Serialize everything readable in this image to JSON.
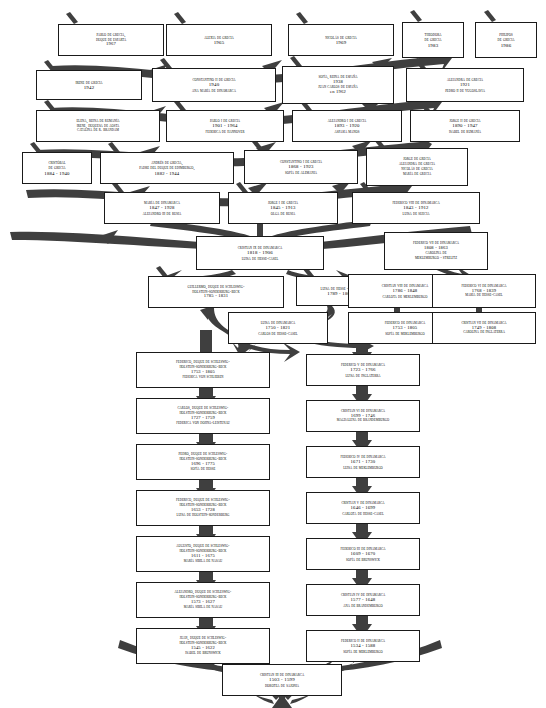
{
  "diagram": {
    "type": "genealogy-tree",
    "orientation": "bottom-up ancestors",
    "colors": {
      "background": "#ffffff",
      "box_border": "#1a1a1a",
      "arrow_fill": "#3f3f3f",
      "text": "#000000"
    },
    "nodes": [
      {
        "id": "n1",
        "lines": [
          "Pablo de Grecia,",
          "Duque de Esparta",
          "1967"
        ],
        "x": 58,
        "y": 24,
        "w": 106,
        "h": 32,
        "fs": 4.6
      },
      {
        "id": "n2",
        "lines": [
          "Alexia de Grecia",
          "1965"
        ],
        "x": 166,
        "y": 24,
        "w": 106,
        "h": 32,
        "fs": 4.9
      },
      {
        "id": "n3",
        "lines": [
          "Nicolás de Grecia",
          "1969"
        ],
        "x": 288,
        "y": 24,
        "w": 106,
        "h": 32,
        "fs": 4.9
      },
      {
        "id": "n4",
        "lines": [
          "Theodora",
          "de Grecia",
          "1983"
        ],
        "x": 402,
        "y": 22,
        "w": 62,
        "h": 36,
        "fs": 4.9
      },
      {
        "id": "n5",
        "lines": [
          "Philipos",
          "de Grecia",
          "1986"
        ],
        "x": 475,
        "y": 22,
        "w": 62,
        "h": 36,
        "fs": 4.9
      },
      {
        "id": "n6",
        "lines": [
          "Irene de Grecia",
          "1942"
        ],
        "x": 36,
        "y": 70,
        "w": 106,
        "h": 30,
        "fs": 4.9
      },
      {
        "id": "n7",
        "lines": [
          "Constantino II de Grecia",
          "1940",
          "Ana María de Dinamarca"
        ],
        "x": 152,
        "y": 68,
        "w": 124,
        "h": 34,
        "fs": 4.9
      },
      {
        "id": "n8",
        "lines": [
          "Sofía, reina de España",
          "1938",
          "Juan Carlos de España",
          "en 1962"
        ],
        "x": 282,
        "y": 66,
        "w": 112,
        "h": 38,
        "fs": 4.6
      },
      {
        "id": "n9",
        "lines": [
          "Alejandra de Grecia",
          "1921",
          "Pedro II de Yugoslavia"
        ],
        "x": 406,
        "y": 68,
        "w": 118,
        "h": 34,
        "fs": 4.7
      },
      {
        "id": "n10",
        "lines": [
          "Elena, reina de Rumanía",
          "Irene, duquesa de Aosta",
          "Catalina de R. Brandam"
        ],
        "x": 36,
        "y": 110,
        "w": 124,
        "h": 32,
        "fs": 4.6
      },
      {
        "id": "n11",
        "lines": [
          "Pablo I de Grecia",
          "1901 - 1964",
          "Federica de Hannover"
        ],
        "x": 166,
        "y": 110,
        "w": 118,
        "h": 32,
        "fs": 4.8
      },
      {
        "id": "n12",
        "lines": [
          "Alejandro I de Grecia",
          "1893 - 1920",
          "Aspasia Manos"
        ],
        "x": 292,
        "y": 110,
        "w": 110,
        "h": 32,
        "fs": 4.8
      },
      {
        "id": "n13",
        "lines": [
          "Jorge II de Grecia",
          "1890 - 1947",
          "Isabel de Rumanía"
        ],
        "x": 410,
        "y": 110,
        "w": 110,
        "h": 32,
        "fs": 4.8
      },
      {
        "id": "n14",
        "lines": [
          "Cristóbal",
          "de Grecia",
          "1884 - 1940"
        ],
        "x": 22,
        "y": 152,
        "w": 70,
        "h": 32,
        "fs": 4.8
      },
      {
        "id": "n15",
        "lines": [
          "Andrés de Grecia,",
          "Padre del Duque de Edimburgo,",
          "1882 - 1944"
        ],
        "x": 100,
        "y": 152,
        "w": 134,
        "h": 32,
        "fs": 4.7
      },
      {
        "id": "n16",
        "lines": [
          "Constantino I de Grecia",
          "1868 - 1923",
          "Sofía de Alemania"
        ],
        "x": 244,
        "y": 150,
        "w": 114,
        "h": 34,
        "fs": 4.8
      },
      {
        "id": "n17",
        "lines": [
          "Jorge de Grecia",
          "Alejandra de Grecia",
          "Nicolás de Grecia",
          "María de Grecia"
        ],
        "x": 366,
        "y": 148,
        "w": 102,
        "h": 38,
        "fs": 4.6
      },
      {
        "id": "n18",
        "lines": [
          "María de Dinamarca",
          "1847 - 1928",
          "Alejandro III de Rusia"
        ],
        "x": 104,
        "y": 192,
        "w": 116,
        "h": 32,
        "fs": 4.8
      },
      {
        "id": "n19",
        "lines": [
          "Jorge I de Grecia",
          "1845 - 1913",
          "Olga de Rusia"
        ],
        "x": 228,
        "y": 192,
        "w": 110,
        "h": 32,
        "fs": 4.8
      },
      {
        "id": "n20",
        "lines": [
          "Federico VIII de Dinamarca",
          "1843 - 1912",
          "Luisa de Suecia"
        ],
        "x": 352,
        "y": 192,
        "w": 128,
        "h": 32,
        "fs": 4.8
      },
      {
        "id": "n21",
        "lines": [
          "Cristian IX de Dinamarca",
          "1818 - 1906",
          "Luisa de Hesse-Casel"
        ],
        "x": 196,
        "y": 236,
        "w": 128,
        "h": 34,
        "fs": 4.9
      },
      {
        "id": "n22",
        "lines": [
          "Federico VII de Dinamarca",
          "1808 - 1863",
          "Carolina de",
          "Meklemburgo - Strelitz"
        ],
        "x": 384,
        "y": 232,
        "w": 104,
        "h": 38,
        "fs": 4.5
      },
      {
        "id": "n23",
        "lines": [
          "Guillermo, Duque de Schleswig-",
          "Holstein-Sonderburg-Beck",
          "1785 - 1831"
        ],
        "x": 148,
        "y": 276,
        "w": 136,
        "h": 32,
        "fs": 4.6
      },
      {
        "id": "n24",
        "lines": [
          "Luisa de Hesse - Casel",
          "1789 - 1867"
        ],
        "x": 296,
        "y": 276,
        "w": 88,
        "h": 30,
        "fs": 4.8
      },
      {
        "id": "n25",
        "lines": [
          "Cristian VIII de Dinamarca",
          "1786 - 1848",
          "Carlota de Meklemburgo"
        ],
        "x": 348,
        "y": 274,
        "w": 114,
        "h": 34,
        "fs": 4.7
      },
      {
        "id": "n26",
        "lines": [
          "Federico VI de Dinamarca",
          "1768 - 1839",
          "María de Hesse-Casel"
        ],
        "x": 432,
        "y": 274,
        "w": 104,
        "h": 34,
        "fs": 4.6
      },
      {
        "id": "n27",
        "lines": [
          "Luisa de Dinamarca",
          "1750 - 1821",
          "Carlos de Hesse-Casel"
        ],
        "x": 228,
        "y": 312,
        "w": 100,
        "h": 32,
        "fs": 4.7
      },
      {
        "id": "n28",
        "lines": [
          "Federico de Dinamarca",
          "1753 - 1805",
          "Sofía de Meklemburgo"
        ],
        "x": 348,
        "y": 312,
        "w": 114,
        "h": 32,
        "fs": 4.7
      },
      {
        "id": "n29",
        "lines": [
          "Cristian VII de Dinamarca",
          "1749 - 1808",
          "Carolina de Inglaterra"
        ],
        "x": 432,
        "y": 312,
        "w": 104,
        "h": 32,
        "fs": 4.6
      },
      {
        "id": "n30",
        "lines": [
          "Federico, duque de Schleswig-",
          "Holstein-Sonderburg-Beck",
          "1753 - 1805",
          "Federica von Schlieben"
        ],
        "x": 136,
        "y": 352,
        "w": 134,
        "h": 36,
        "fs": 4.5
      },
      {
        "id": "n31",
        "lines": [
          "Federico V de Dinamarca",
          "1723 - 1766",
          "Luisa de Inglaterra"
        ],
        "x": 306,
        "y": 354,
        "w": 114,
        "h": 32,
        "fs": 4.8
      },
      {
        "id": "n32",
        "lines": [
          "Carlos, duque de Schleswig-",
          "Holstein-Sonderburg-Beck",
          "1727 - 1759",
          "Federica von Dohna-Leistenau"
        ],
        "x": 136,
        "y": 398,
        "w": 134,
        "h": 36,
        "fs": 4.5
      },
      {
        "id": "n33",
        "lines": [
          "Cristian VI de Dinamarca",
          "1699 - 1746",
          "Magdalena de Brandemburgo"
        ],
        "x": 306,
        "y": 400,
        "w": 114,
        "h": 32,
        "fs": 4.6
      },
      {
        "id": "n34",
        "lines": [
          "Pedro, duque de Schleswig-",
          "Holstein-Sonderburg-Beck",
          "1696 - 1775",
          "Sofía de Hesse"
        ],
        "x": 136,
        "y": 444,
        "w": 134,
        "h": 36,
        "fs": 4.5
      },
      {
        "id": "n35",
        "lines": [
          "Federico IV de Dinamarca",
          "1671 - 1730",
          "Luisa de Meklemburgo"
        ],
        "x": 306,
        "y": 446,
        "w": 114,
        "h": 32,
        "fs": 4.7
      },
      {
        "id": "n36",
        "lines": [
          "Federico, duque de Schleswig-",
          "Holstein-Sonderburg-Beck",
          "1653 - 1728",
          "Luisa de Holstein-Sonderburg"
        ],
        "x": 136,
        "y": 490,
        "w": 134,
        "h": 36,
        "fs": 4.5
      },
      {
        "id": "n37",
        "lines": [
          "Cristian V de Dinamarca",
          "1646 - 1699",
          "Carlota de Hesse-Casel"
        ],
        "x": 306,
        "y": 492,
        "w": 114,
        "h": 32,
        "fs": 4.7
      },
      {
        "id": "n38",
        "lines": [
          "Augusto, duque de Schleswig-",
          "Holstein-Sonderburg-Beck",
          "1611 - 1675",
          "María Sibila de Nasau"
        ],
        "x": 136,
        "y": 536,
        "w": 134,
        "h": 36,
        "fs": 4.5
      },
      {
        "id": "n39",
        "lines": [
          "Federico III de Dinamarca",
          "1609 - 1670",
          "Sofía de Brunswick"
        ],
        "x": 306,
        "y": 538,
        "w": 114,
        "h": 32,
        "fs": 4.7
      },
      {
        "id": "n40",
        "lines": [
          "Alejandro, duque de Schleswig-",
          "Holstein-Sonderburg-Beck",
          "1573 - 1627",
          "María Sibila de Nasau"
        ],
        "x": 136,
        "y": 582,
        "w": 134,
        "h": 36,
        "fs": 4.5
      },
      {
        "id": "n41",
        "lines": [
          "Cristian IV de Dinamarca",
          "1577 - 1648",
          "Ana de Brandemburgo"
        ],
        "x": 306,
        "y": 584,
        "w": 114,
        "h": 32,
        "fs": 4.7
      },
      {
        "id": "n42",
        "lines": [
          "Juan, duque de Schleswig-",
          "Holstein-Sonderburg-Beck",
          "1545 - 1622",
          "Isabel de Brunswick"
        ],
        "x": 136,
        "y": 628,
        "w": 134,
        "h": 36,
        "fs": 4.5
      },
      {
        "id": "n43",
        "lines": [
          "Federico II de Dinamarca",
          "1534 - 1588",
          "Sofía de Meklemburgo"
        ],
        "x": 306,
        "y": 630,
        "w": 114,
        "h": 32,
        "fs": 4.7
      },
      {
        "id": "n44",
        "lines": [
          "Cristian III de Dinamarca",
          "1503 - 1599",
          "Dorotea de Sajonia"
        ],
        "x": 222,
        "y": 664,
        "w": 120,
        "h": 32,
        "fs": 4.9
      }
    ]
  }
}
